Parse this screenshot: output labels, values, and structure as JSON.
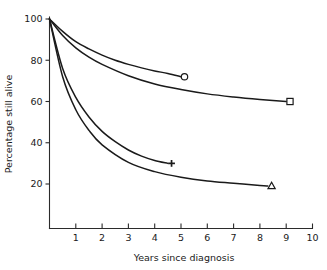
{
  "chart_data": {
    "type": "line",
    "title": "",
    "subtitle": "",
    "xlabel": "Years since diagnosis",
    "ylabel": "Percentage still alive",
    "xlim": [
      0,
      10
    ],
    "ylim": [
      0,
      100
    ],
    "grid": false,
    "legend_position": "none",
    "x_ticks": [
      1,
      2,
      3,
      4,
      5,
      6,
      7,
      8,
      9,
      10
    ],
    "x_tick_labels": [
      "1",
      "2",
      "3",
      "4",
      "5",
      "6",
      "7",
      "8",
      "9",
      "10"
    ],
    "y_ticks": [
      20,
      40,
      60,
      80,
      100
    ],
    "y_tick_labels": [
      "20",
      "40",
      "60",
      "80",
      "100"
    ],
    "series": [
      {
        "name": "curve-circle",
        "marker": "circle",
        "marker_style": "open",
        "endpoint_label": "",
        "x": [
          0,
          0.5,
          1,
          1.5,
          2,
          2.5,
          3,
          3.5,
          4,
          4.5,
          5
        ],
        "values": [
          100,
          94,
          89,
          85.5,
          82.5,
          80,
          78,
          76.3,
          74.8,
          73.6,
          72
        ],
        "endpoint": {
          "x": 5,
          "y": 72
        }
      },
      {
        "name": "curve-square",
        "marker": "square",
        "marker_style": "open",
        "endpoint_label": "",
        "x": [
          0,
          0.5,
          1,
          1.5,
          2,
          3,
          4,
          5,
          6,
          7,
          8,
          9
        ],
        "values": [
          100,
          92,
          86,
          81.5,
          78,
          72.5,
          68.5,
          65.8,
          63.7,
          62.2,
          61,
          60
        ],
        "endpoint": {
          "x": 9,
          "y": 60
        }
      },
      {
        "name": "curve-plus",
        "marker": "plus",
        "marker_style": "solid",
        "endpoint_label": "",
        "x": [
          0,
          0.5,
          1,
          1.5,
          2,
          2.5,
          3,
          3.5,
          4,
          4.5
        ],
        "values": [
          100,
          76,
          62,
          52.5,
          45.5,
          40.5,
          36.5,
          33.5,
          31.4,
          30
        ],
        "endpoint": {
          "x": 4.5,
          "y": 30
        }
      },
      {
        "name": "curve-triangle",
        "marker": "triangle",
        "marker_style": "open",
        "endpoint_label": "",
        "x": [
          0,
          0.5,
          1,
          1.5,
          2,
          3,
          4,
          5,
          6,
          7,
          8,
          8.3
        ],
        "values": [
          100,
          72,
          56,
          46,
          39,
          30.5,
          26,
          23.3,
          21.5,
          20.4,
          19.3,
          19
        ],
        "endpoint": {
          "x": 8.3,
          "y": 19
        }
      }
    ]
  },
  "colors": {
    "line": "#1a1a1a",
    "axis": "#2b2b2b",
    "background": "#ffffff"
  }
}
